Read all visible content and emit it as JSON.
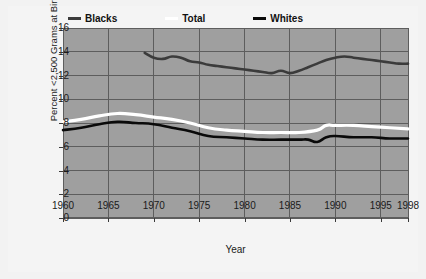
{
  "chart_data": {
    "type": "line",
    "title": "",
    "xlabel": "Year",
    "ylabel": "Percent <2,500 Grams at Birth",
    "xlim": [
      1960,
      1998
    ],
    "ylim": [
      0,
      16
    ],
    "grid": true,
    "legend_position": "top-center",
    "yticks": [
      0,
      2,
      4,
      6,
      8,
      10,
      12,
      14,
      16
    ],
    "ytick_labels": [
      "0",
      "2",
      "4",
      "6",
      "8",
      "10",
      "12",
      "14",
      "16"
    ],
    "xticks": [
      1960,
      1965,
      1970,
      1975,
      1980,
      1985,
      1990,
      1995,
      1998
    ],
    "xtick_labels": [
      "1960",
      "1965",
      "1970",
      "1975",
      "1980",
      "1985",
      "1990",
      "1995",
      "1998"
    ],
    "series": [
      {
        "name": "Blacks",
        "color": "#3b3b3b",
        "x": [
          1969,
          1970,
          1971,
          1972,
          1973,
          1974,
          1975,
          1976,
          1977,
          1978,
          1979,
          1980,
          1981,
          1982,
          1983,
          1984,
          1985,
          1986,
          1987,
          1988,
          1989,
          1990,
          1991,
          1992,
          1993,
          1994,
          1995,
          1996,
          1997,
          1998
        ],
        "values": [
          13.9,
          13.5,
          13.4,
          13.6,
          13.5,
          13.2,
          13.1,
          12.9,
          12.8,
          12.7,
          12.6,
          12.5,
          12.4,
          12.3,
          12.2,
          12.4,
          12.2,
          12.4,
          12.7,
          13.0,
          13.3,
          13.5,
          13.6,
          13.5,
          13.4,
          13.3,
          13.2,
          13.1,
          13.0,
          13.0
        ]
      },
      {
        "name": "Total",
        "color": "#ffffff",
        "x": [
          1960,
          1962,
          1964,
          1966,
          1968,
          1970,
          1972,
          1974,
          1976,
          1978,
          1980,
          1982,
          1984,
          1986,
          1988,
          1989,
          1990,
          1992,
          1994,
          1996,
          1998
        ],
        "values": [
          8.1,
          8.3,
          8.6,
          8.8,
          8.7,
          8.5,
          8.3,
          8.0,
          7.6,
          7.4,
          7.3,
          7.2,
          7.2,
          7.2,
          7.4,
          7.8,
          7.8,
          7.8,
          7.7,
          7.6,
          7.5
        ]
      },
      {
        "name": "Whites",
        "color": "#0a0a0a",
        "x": [
          1960,
          1962,
          1964,
          1966,
          1968,
          1970,
          1972,
          1974,
          1976,
          1978,
          1980,
          1982,
          1984,
          1986,
          1987,
          1988,
          1989,
          1990,
          1992,
          1994,
          1996,
          1998
        ],
        "values": [
          7.4,
          7.6,
          7.9,
          8.1,
          8.0,
          7.9,
          7.6,
          7.3,
          6.9,
          6.8,
          6.7,
          6.6,
          6.6,
          6.6,
          6.6,
          6.4,
          6.8,
          6.9,
          6.8,
          6.8,
          6.7,
          6.7
        ]
      }
    ]
  },
  "legend": {
    "items": [
      {
        "label": "Blacks",
        "color": "#3b3b3b"
      },
      {
        "label": "Total",
        "color": "#ffffff"
      },
      {
        "label": "Whites",
        "color": "#0a0a0a"
      }
    ]
  },
  "colors": {
    "plot_background": "#9f9f9f",
    "figure_background": "#f4f4f4",
    "gridline": "#5d5d5d",
    "axis_text": "#1a1a1a"
  }
}
